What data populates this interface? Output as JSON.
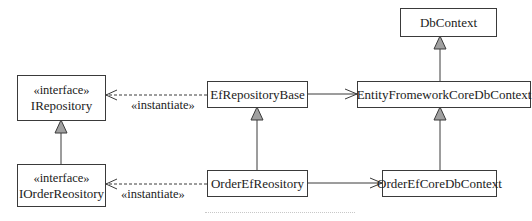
{
  "diagram": {
    "type": "UML class diagram",
    "classes": [
      {
        "id": "irepository",
        "stereotype": "«interface»",
        "name": "IRepository"
      },
      {
        "id": "iorderrepository",
        "stereotype": "«interface»",
        "name": "IOrderReository"
      },
      {
        "id": "efrepositorybase",
        "name": "EfRepositoryBase"
      },
      {
        "id": "orderefrepository",
        "name": "OrderEfReository"
      },
      {
        "id": "dbcontext",
        "name": "DbContext"
      },
      {
        "id": "efcoredbcontext",
        "name": "EntityFromeworkCoreDbContext"
      },
      {
        "id": "orderefcoredbcontext",
        "name": "OrderEfCoreDbContext"
      }
    ],
    "relations": [
      {
        "from": "IOrderReository",
        "to": "IRepository",
        "kind": "generalization"
      },
      {
        "from": "OrderEfReository",
        "to": "EfRepositoryBase",
        "kind": "generalization"
      },
      {
        "from": "EntityFromeworkCoreDbContext",
        "to": "DbContext",
        "kind": "generalization"
      },
      {
        "from": "OrderEfCoreDbContext",
        "to": "EntityFromeworkCoreDbContext",
        "kind": "generalization"
      },
      {
        "from": "EfRepositoryBase",
        "to": "IRepository",
        "kind": "dependency",
        "label": "«instantiate»"
      },
      {
        "from": "OrderEfReository",
        "to": "IOrderReository",
        "kind": "dependency",
        "label": "«instantiate»"
      },
      {
        "from": "EfRepositoryBase",
        "to": "EntityFromeworkCoreDbContext",
        "kind": "association"
      },
      {
        "from": "OrderEfReository",
        "to": "OrderEfCoreDbContext",
        "kind": "association"
      }
    ],
    "labels": {
      "instantiate_top": "«instantiate»",
      "instantiate_bottom": "«instantiate»"
    }
  },
  "colors": {
    "line": "#3a3a3a",
    "arrowhead_fill": "#a0a0a0",
    "background": "#ffffff"
  }
}
